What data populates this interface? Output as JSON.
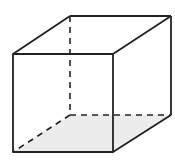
{
  "diagram": {
    "type": "cube-wireframe",
    "colors": {
      "background": "#ffffff",
      "edge": "#222222",
      "bottom_face_fill": "#ececec"
    },
    "vertices": {
      "front_top_left": [
        13,
        54
      ],
      "front_top_right": [
        113,
        54
      ],
      "front_bottom_left": [
        13,
        152
      ],
      "front_bottom_right": [
        113,
        152
      ],
      "back_top_left": [
        70,
        16
      ],
      "back_top_right": [
        171,
        16
      ],
      "back_bottom_left": [
        70,
        115
      ],
      "back_bottom_right": [
        171,
        115
      ]
    },
    "hidden_edges": [
      "back_top_left-back_bottom_left",
      "back_bottom_left-back_bottom_right",
      "back_bottom_left-front_bottom_left"
    ],
    "shaded_face": "bottom"
  }
}
